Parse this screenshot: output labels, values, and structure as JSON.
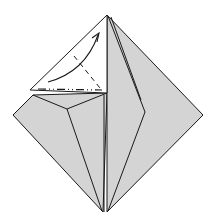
{
  "diagram": {
    "type": "origami-fold-step",
    "colors": {
      "paper_colored": "#d4d4d4",
      "paper_white": "#ffffff",
      "line": "#1a1a1a",
      "background": "#ffffff"
    },
    "symbols": [
      {
        "name": "valley-fold-arrow",
        "direction": "up-right"
      },
      {
        "name": "valley-fold-line",
        "orientation": "diagonal"
      },
      {
        "name": "mountain-fold-line",
        "orientation": "horizontal"
      }
    ]
  }
}
